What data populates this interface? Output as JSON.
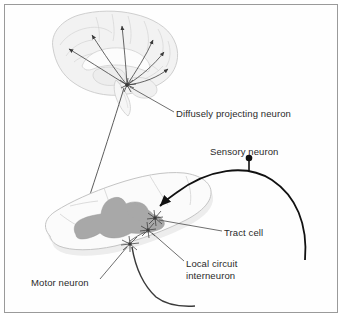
{
  "figure": {
    "title_visible": false,
    "background_color": "#ffffff",
    "border_color": "#9a9a9a",
    "text_color": "#2a2a2a"
  },
  "labels": {
    "diffusely_projecting_neuron": "Diffusely projecting neuron",
    "sensory_neuron": "Sensory neuron",
    "tract_cell": "Tract cell",
    "local_circuit_interneuron_line1": "Local circuit",
    "local_circuit_interneuron_line2": "interneuron",
    "motor_neuron": "Motor neuron"
  },
  "structures": {
    "brain": {
      "name": "brain-sagittal-section",
      "fill": "#f1f1f1",
      "stroke": "#c9c9c9"
    },
    "spinal_cord": {
      "name": "spinal-cord-cross-section",
      "fill": "#fbfbfb",
      "stroke": "#c9c9c9",
      "gray_matter_fill": "#a8a8a8"
    }
  },
  "neurons": {
    "diffusely_projecting": {
      "soma_location": "brainstem",
      "projection_count": 6,
      "target": "cerebral cortex",
      "color": "#3a3a3a"
    },
    "sensory": {
      "soma_shape": "filled-circle",
      "color": "#111111",
      "path": "arc entering dorsal spinal cord"
    },
    "tract_cell": {
      "color": "#3a3a3a"
    },
    "local_circuit_interneuron": {
      "color": "#3a3a3a"
    },
    "motor_neuron": {
      "color": "#3a3a3a",
      "axon_exit": "ventral root"
    }
  }
}
